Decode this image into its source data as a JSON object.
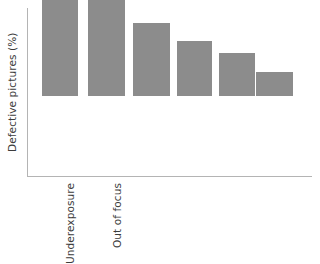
{
  "chart_data": {
    "type": "bar",
    "title": "",
    "subtitle": "",
    "xlabel": "",
    "ylabel": "Defective pictures (%)",
    "categories": [
      "Underexposure",
      "Out of focus",
      "",
      "",
      "",
      ""
    ],
    "tick_labels_shown": [
      "Underexposure",
      "Out of focus"
    ],
    "values": [
      100,
      72,
      46,
      35,
      27,
      15
    ],
    "ylim": [
      0,
      106
    ],
    "xlim": [
      0,
      6
    ],
    "grid": false,
    "legend": null,
    "legend_position": "none",
    "y_tick_labels": [],
    "x_tick_labels": [
      "Underexposure",
      "Out of focus",
      "",
      "",
      "",
      ""
    ],
    "annotations": [],
    "series": [
      {
        "name": "Defective pictures (%)",
        "values": [
          100,
          72,
          46,
          35,
          27,
          15
        ]
      }
    ],
    "bar_color": "#8c8c8c",
    "axis_color": "#b4b4b4",
    "text_color": "#3c3c3c",
    "background_color": "#ffffff",
    "orientation": "vertical",
    "sorted": "descending"
  },
  "bars": [
    {
      "label": "Underexposure",
      "value": 100,
      "left": 42,
      "width": 36,
      "height": 158
    },
    {
      "label": "Out of focus",
      "value": 72,
      "left": 88,
      "width": 37,
      "height": 114
    },
    {
      "label": "",
      "value": 46,
      "left": 133,
      "width": 37,
      "height": 73
    },
    {
      "label": "",
      "value": 35,
      "left": 177,
      "width": 35,
      "height": 56
    },
    {
      "label": "",
      "value": 27,
      "left": 219,
      "width": 36,
      "height": 43
    },
    {
      "label": "",
      "value": 15,
      "left": 256,
      "width": 37,
      "height": 24
    }
  ],
  "axis": {
    "y_label": "Defective pictures (%)"
  }
}
